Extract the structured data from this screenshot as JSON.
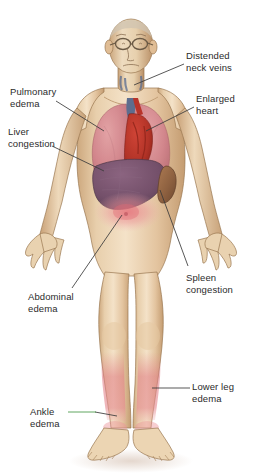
{
  "illustration": {
    "title": "Congestive heart failure signs",
    "subject": "Elderly man with eyeglasses, front view, full body",
    "background_color": "#ffffff",
    "text_color": "#2b2b2b",
    "leader_line_color": "#3a3a3a",
    "ankle_leader_accent_color": "#4e9c4e",
    "skin_color": "#e8cfad",
    "skin_shadow_color": "#c6a membrane"
  },
  "palette": {
    "skin_light": "#f2ddc0",
    "skin_mid": "#e2c39c",
    "skin_dark": "#c7a379",
    "outline": "#8c6a49",
    "lung": "#d98b92",
    "lung_dark": "#c2747d",
    "heart": "#c0392b",
    "heart_dark": "#8e2b20",
    "vein_blue": "#5a6b8c",
    "liver": "#7d5a73",
    "liver_dark": "#5f4257",
    "spleen": "#9c6b46",
    "edema_pink": "#e8838a",
    "edema_soft": "#f0a8ab",
    "shadow": "#d9c3b4"
  },
  "labels": [
    {
      "id": "distended-neck-veins",
      "text": "Distended\nneck veins",
      "x": 186,
      "y": 50,
      "align": "left"
    },
    {
      "id": "enlarged-heart",
      "text": "Enlarged\nheart",
      "x": 196,
      "y": 93,
      "align": "left"
    },
    {
      "id": "pulmonary-edema",
      "text": "Pulmonary\nedema",
      "x": 10,
      "y": 86,
      "align": "left"
    },
    {
      "id": "liver-congestion",
      "text": "Liver\ncongestion",
      "x": 8,
      "y": 126,
      "align": "left"
    },
    {
      "id": "spleen-congestion",
      "text": "Spleen\ncongestion",
      "x": 186,
      "y": 272,
      "align": "left"
    },
    {
      "id": "abdominal-edema",
      "text": "Abdominal\nedema",
      "x": 28,
      "y": 291,
      "align": "left"
    },
    {
      "id": "lower-leg-edema",
      "text": "Lower leg\nedema",
      "x": 192,
      "y": 381,
      "align": "left"
    },
    {
      "id": "ankle-edema",
      "text": "Ankle\nedema",
      "x": 30,
      "y": 406,
      "align": "left"
    }
  ],
  "leader_lines": [
    {
      "id": "leader-distended-neck-veins",
      "from": [
        184,
        64
      ],
      "to": [
        134,
        85
      ]
    },
    {
      "id": "leader-enlarged-heart",
      "from": [
        194,
        107
      ],
      "to": [
        146,
        131
      ]
    },
    {
      "id": "leader-pulmonary-edema",
      "from": [
        56,
        101
      ],
      "to": [
        104,
        131
      ]
    },
    {
      "id": "leader-liver-congestion",
      "from": [
        52,
        146
      ],
      "to": [
        104,
        171
      ]
    },
    {
      "id": "leader-spleen-congestion",
      "from": [
        188,
        266
      ],
      "to": [
        160,
        190
      ]
    },
    {
      "id": "leader-abdominal-edema",
      "from": [
        72,
        288
      ],
      "to": [
        122,
        215
      ]
    },
    {
      "id": "leader-lower-leg-edema",
      "from": [
        190,
        388
      ],
      "to": [
        152,
        388
      ]
    },
    {
      "id": "leader-ankle-edema",
      "from": [
        68,
        412
      ],
      "to": [
        115,
        412
      ],
      "accent_to": [
        95,
        412
      ]
    }
  ],
  "anatomy": [
    {
      "id": "head",
      "label": "Head with eyeglasses and balding scalp"
    },
    {
      "id": "eyeglasses",
      "label": "Eyeglasses"
    },
    {
      "id": "neck-veins",
      "label": "Distended jugular neck veins"
    },
    {
      "id": "left-lung",
      "label": "Left lung with pulmonary edema"
    },
    {
      "id": "right-lung",
      "label": "Right lung with pulmonary edema"
    },
    {
      "id": "heart",
      "label": "Enlarged heart"
    },
    {
      "id": "great-vessels",
      "label": "Great vessels above heart"
    },
    {
      "id": "liver",
      "label": "Congested enlarged liver"
    },
    {
      "id": "spleen",
      "label": "Congested spleen"
    },
    {
      "id": "abdomen-edema",
      "label": "Abdominal edema flush"
    },
    {
      "id": "left-leg-edema",
      "label": "Lower left leg edema"
    },
    {
      "id": "right-leg-edema",
      "label": "Lower right leg edema"
    },
    {
      "id": "ankles",
      "label": "Swollen ankles"
    },
    {
      "id": "feet",
      "label": "Feet"
    },
    {
      "id": "left-hand",
      "label": "Left hand"
    },
    {
      "id": "right-hand",
      "label": "Right hand"
    },
    {
      "id": "floor-shadow",
      "label": "Shadow beneath feet"
    }
  ]
}
